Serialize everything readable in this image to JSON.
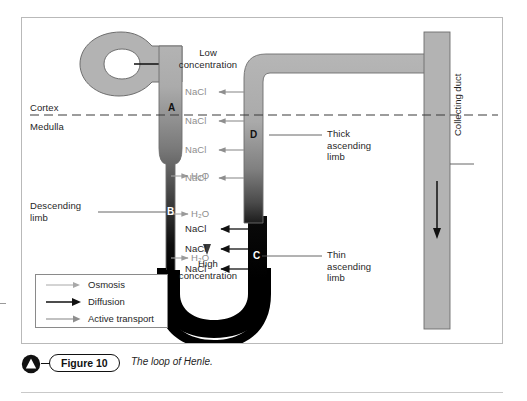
{
  "figure": {
    "number_label": "Figure 10",
    "caption": "The loop of Henle.",
    "badge_icon": "triangle-badge-icon"
  },
  "regions": {
    "cortex_label": "Cortex",
    "medulla_label": "Medulla"
  },
  "concentration_axis": {
    "top_label": "Low\nconcentration",
    "bottom_label": "High\nconcentration"
  },
  "structure_labels": {
    "descending_limb": "Descending\nlimb",
    "thick_ascending_limb": "Thick\nascending\nlimb",
    "thin_ascending_limb": "Thin\nascending\nlimb",
    "collecting_duct": "Collecting duct"
  },
  "letter_markers": [
    {
      "letter": "A",
      "structure": "descending-limb-cortex"
    },
    {
      "letter": "B",
      "structure": "descending-limb-medulla"
    },
    {
      "letter": "C",
      "structure": "thin-ascending-limb"
    },
    {
      "letter": "D",
      "structure": "thick-ascending-limb"
    }
  ],
  "water_transport": [
    {
      "label": "H₂O",
      "mechanism": "osmosis"
    },
    {
      "label": "H₂O",
      "mechanism": "osmosis"
    },
    {
      "label": "H₂O",
      "mechanism": "osmosis"
    }
  ],
  "salt_transport_active": [
    {
      "label": "NaCl",
      "mechanism": "active-transport"
    },
    {
      "label": "NaCl",
      "mechanism": "active-transport"
    },
    {
      "label": "NaCl",
      "mechanism": "active-transport"
    },
    {
      "label": "NaCl",
      "mechanism": "active-transport"
    }
  ],
  "salt_transport_diffusion": [
    {
      "label": "NaCl",
      "mechanism": "diffusion"
    },
    {
      "label": "NaCl",
      "mechanism": "diffusion"
    },
    {
      "label": "NaCl",
      "mechanism": "diffusion"
    }
  ],
  "legend": {
    "items": [
      {
        "label": "Osmosis",
        "arrow": "thin-gray-arrow",
        "color": "#9a9a9a"
      },
      {
        "label": "Diffusion",
        "arrow": "thick-black-arrow",
        "color": "#111111"
      },
      {
        "label": "Active transport",
        "arrow": "medium-gray-arrow",
        "color": "#8e8e8e"
      }
    ]
  },
  "colors": {
    "tubule_light": "#b3b3b3",
    "tubule_dark": "#000000",
    "outline": "#6e6e6e",
    "gray_text": "#8e8e8e",
    "body_text": "#1f1f1f",
    "frame_border": "#b9b9b9"
  }
}
